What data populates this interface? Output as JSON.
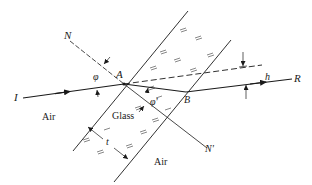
{
  "figure": {
    "labels": {
      "normal_top": "N",
      "normal_bottom": "N'",
      "angle_incidence": "φ",
      "angle_refraction": "φ'",
      "point_entry": "A",
      "point_exit": "B",
      "incident_ray": "I",
      "emergent_ray": "R",
      "displacement": "h",
      "thickness": "t",
      "medium_left": "Air",
      "medium_slab": "Glass",
      "medium_right": "Air"
    },
    "colors": {
      "ink": "#1a1a1a",
      "hatch": "#555555",
      "background": "#ffffff"
    }
  }
}
